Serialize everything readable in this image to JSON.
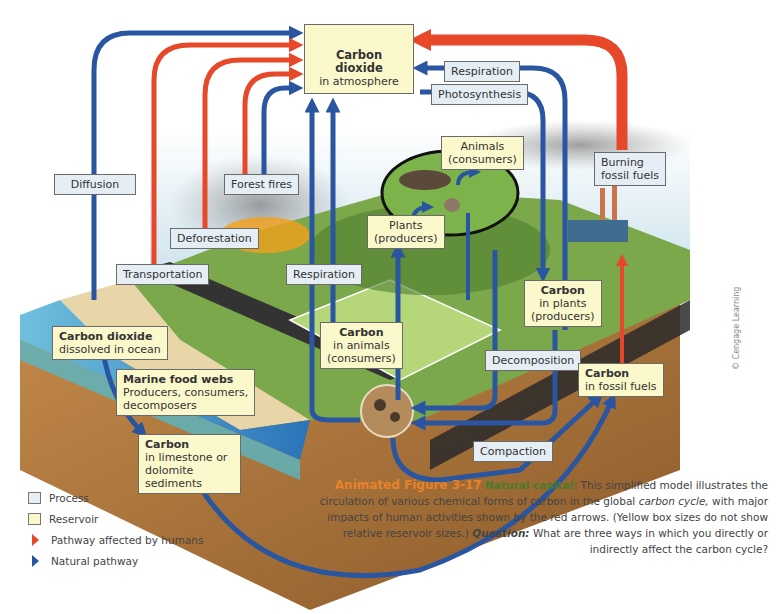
{
  "colors": {
    "human_arrow": "#e8482a",
    "natural_arrow": "#2a55a0",
    "process_fill": "#e6eef5",
    "reservoir_fill": "#fbf8cc",
    "caption_figure": "#e8822a",
    "caption_natural_capital": "#4a7a2c"
  },
  "atmosphere": {
    "title": "Carbon dioxide",
    "subtitle": "in atmosphere"
  },
  "processes": {
    "respiration_top": "Respiration",
    "photosynthesis": "Photosynthesis",
    "diffusion": "Diffusion",
    "forest_fires": "Forest fires",
    "deforestation": "Deforestation",
    "transportation": "Transportation",
    "respiration_animals": "Respiration",
    "burning_fossil_fuels_1": "Burning",
    "burning_fossil_fuels_2": "fossil fuels",
    "decomposition": "Decomposition",
    "compaction": "Compaction"
  },
  "reservoirs": {
    "animals": {
      "line1": "Animals",
      "line2": "(consumers)"
    },
    "plants": {
      "line1": "Plants",
      "line2": "(producers)"
    },
    "carbon_plants": {
      "title": "Carbon",
      "line1": "in plants",
      "line2": "(producers)"
    },
    "carbon_animals": {
      "title": "Carbon",
      "line1": "in animals",
      "line2": "(consumers)"
    },
    "carbon_fossil": {
      "title": "Carbon",
      "line1": "in fossil fuels"
    },
    "co2_ocean": {
      "title": "Carbon dioxide",
      "line1": "dissolved in ocean"
    },
    "marine": {
      "title": "Marine food webs",
      "line1": "Producers, consumers,",
      "line2": "decomposers"
    },
    "limestone": {
      "title": "Carbon",
      "line1": "in limestone or",
      "line2": "dolomite sediments"
    }
  },
  "legend": {
    "process": "Process",
    "reservoir": "Reservoir",
    "human": "Pathway affected by humans",
    "natural": "Natural pathway"
  },
  "caption": {
    "figure": "Animated Figure 3-17",
    "label": "Natural capital:",
    "text1": " This simplified model illustrates the circulation of various chemical forms of carbon in the global ",
    "italic": "carbon cycle,",
    "text2": " with major impacts of human activities shown by the red arrows. (Yellow box sizes do not show relative reservoir sizes.) ",
    "question_label": "Question:",
    "question": " What are three ways in which you directly or indirectly affect the carbon cycle?"
  },
  "credit": "© Cengage Learning"
}
